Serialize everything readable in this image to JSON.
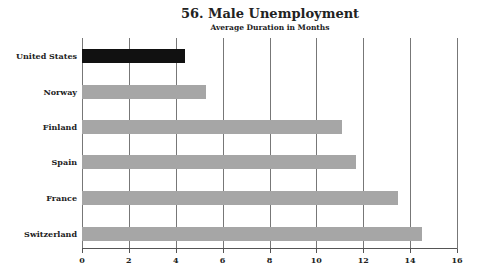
{
  "chart_data": {
    "type": "bar",
    "orientation": "horizontal",
    "title": "56. Male Unemployment",
    "subtitle": "Average Duration in Months",
    "xlabel": "",
    "ylabel": "",
    "categories": [
      "United States",
      "Norway",
      "Finland",
      "Spain",
      "France",
      "Switzerland"
    ],
    "values": [
      4.4,
      5.3,
      11.1,
      11.7,
      13.5,
      14.5
    ],
    "colors": [
      "#111111",
      "#a6a6a6",
      "#a6a6a6",
      "#a6a6a6",
      "#a6a6a6",
      "#a6a6a6"
    ],
    "xlim": [
      0,
      16
    ],
    "xticks": [
      "0",
      "2",
      "4",
      "6",
      "8",
      "10",
      "12",
      "14",
      "16"
    ],
    "grid": true,
    "legend": "none"
  }
}
